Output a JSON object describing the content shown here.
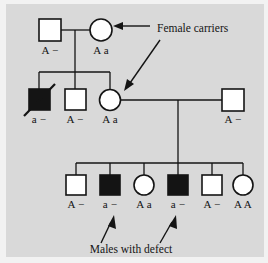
{
  "figure": {
    "kind": "pedigree-chart",
    "background_color": "#d9d9d9",
    "outer_color": "#f2f2f2",
    "line_color": "#141414",
    "affected_fill": "#141414",
    "unaffected_fill": "#ffffff"
  },
  "annotations": {
    "female_carriers": "Female carriers",
    "males_with_defect": "Males with defect"
  },
  "generations": [
    {
      "id": "generation-1",
      "individuals": [
        {
          "id": "i-1-1",
          "shape": "square",
          "sex": "male",
          "affected": false,
          "deceased": false,
          "genotype": "A −",
          "cx": 50,
          "cy": 30
        },
        {
          "id": "i-1-2",
          "shape": "circle",
          "sex": "female",
          "affected": false,
          "deceased": false,
          "genotype": "A a",
          "cx": 101,
          "cy": 30
        }
      ]
    },
    {
      "id": "generation-2",
      "individuals": [
        {
          "id": "i-2-1",
          "shape": "square",
          "sex": "male",
          "affected": true,
          "deceased": true,
          "genotype": "a −",
          "cx": 39,
          "cy": 100
        },
        {
          "id": "i-2-2",
          "shape": "square",
          "sex": "male",
          "affected": false,
          "deceased": false,
          "genotype": "A −",
          "cx": 75,
          "cy": 100
        },
        {
          "id": "i-2-3",
          "shape": "circle",
          "sex": "female",
          "affected": false,
          "deceased": false,
          "genotype": "A a",
          "cx": 110,
          "cy": 100
        },
        {
          "id": "i-2-4",
          "shape": "square",
          "sex": "male",
          "affected": false,
          "deceased": false,
          "genotype": "A −",
          "cx": 233,
          "cy": 100
        }
      ]
    },
    {
      "id": "generation-3",
      "individuals": [
        {
          "id": "i-3-1",
          "shape": "square",
          "sex": "male",
          "affected": false,
          "deceased": false,
          "genotype": "A −",
          "cx": 76,
          "cy": 185
        },
        {
          "id": "i-3-2",
          "shape": "square",
          "sex": "male",
          "affected": true,
          "deceased": false,
          "genotype": "a −",
          "cx": 110,
          "cy": 185
        },
        {
          "id": "i-3-3",
          "shape": "circle",
          "sex": "female",
          "affected": false,
          "deceased": false,
          "genotype": "A a",
          "cx": 144,
          "cy": 185
        },
        {
          "id": "i-3-4",
          "shape": "square",
          "sex": "male",
          "affected": true,
          "deceased": false,
          "genotype": "a −",
          "cx": 178,
          "cy": 185
        },
        {
          "id": "i-3-5",
          "shape": "square",
          "sex": "male",
          "affected": false,
          "deceased": false,
          "genotype": "A −",
          "cx": 212,
          "cy": 185
        },
        {
          "id": "i-3-6",
          "shape": "circle",
          "sex": "female",
          "affected": false,
          "deceased": false,
          "genotype": "A A",
          "cx": 243,
          "cy": 185
        }
      ]
    }
  ]
}
